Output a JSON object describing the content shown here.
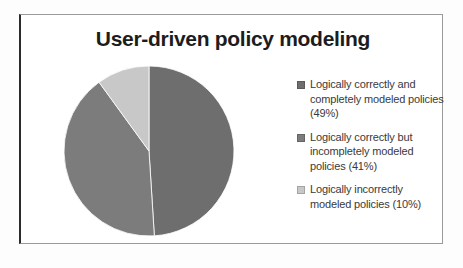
{
  "chart_data": {
    "type": "pie",
    "title": "User-driven policy modeling",
    "xlabel": "",
    "ylabel": "",
    "legend_position": "right",
    "grid": false,
    "categories": [
      "Logically correctly and completely modeled policies (49%)",
      "Logically correctly but incompletely modeled policies (41%)",
      "Logically incorrectly modeled policies (10%)"
    ],
    "values": [
      49,
      41,
      10
    ],
    "slices": [
      {
        "label": "Logically correctly and completely modeled policies (49%)",
        "value": 49,
        "color": "#6e6e6e"
      },
      {
        "label": "Logically correctly but incompletely modeled policies (41%)",
        "value": 41,
        "color": "#7c7c7c"
      },
      {
        "label": "Logically incorrectly modeled policies (10%)",
        "value": 10,
        "color": "#c8c8c8"
      }
    ]
  },
  "legend": {
    "items": [
      {
        "label": "Logically correctly and completely modeled policies (49%)",
        "color": "#6e6e6e"
      },
      {
        "label": "Logically correctly but incompletely modeled policies (41%)",
        "color": "#7c7c7c"
      },
      {
        "label": "Logically incorrectly modeled policies (10%)",
        "color": "#c8c8c8"
      }
    ]
  },
  "colors": {
    "slice_1": "#6e6e6e",
    "slice_2": "#7c7c7c",
    "slice_3": "#c8c8c8",
    "title_text": "#1c1c1c",
    "legend_text": "#3a3a3a",
    "frame_border": "#9a9a9a",
    "frame_spine": "#2b2b2b",
    "background": "#ffffff"
  }
}
